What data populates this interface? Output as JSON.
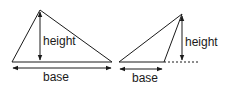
{
  "diagram": {
    "left_triangle": {
      "height_label": "height",
      "base_label": "base"
    },
    "right_triangle": {
      "height_label": "height",
      "base_label": "base"
    },
    "colors": {
      "stroke": "#1a1a1a",
      "background": "#ffffff"
    }
  }
}
